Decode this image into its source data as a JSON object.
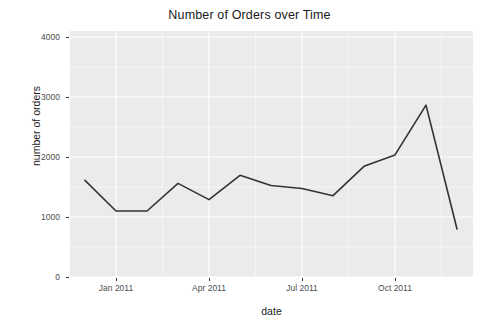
{
  "chart_data": {
    "type": "line",
    "title": "Number of Orders over Time",
    "xlabel": "date",
    "ylabel": "number of orders",
    "grid": true,
    "legend": "none",
    "panel_background": "#ebebeb",
    "grid_color": "#ffffff",
    "line_color": "#333333",
    "ylim": [
      0,
      4100
    ],
    "y_ticks": [
      {
        "value": 0,
        "label": "0"
      },
      {
        "value": 1000,
        "label": "1000"
      },
      {
        "value": 2000,
        "label": "2000"
      },
      {
        "value": 3000,
        "label": "3000"
      },
      {
        "value": 4000,
        "label": "4000"
      }
    ],
    "x_ticks": [
      {
        "x": "2011-01",
        "label": "Jan 2011"
      },
      {
        "x": "2011-04",
        "label": "Apr 2011"
      },
      {
        "x": "2011-07",
        "label": "Jul 2011"
      },
      {
        "x": "2011-10",
        "label": "Oct 2011"
      }
    ],
    "x": [
      "2010-12",
      "2011-01",
      "2011-02",
      "2011-03",
      "2011-04",
      "2011-05",
      "2011-06",
      "2011-07",
      "2011-08",
      "2011-09",
      "2011-10",
      "2011-11",
      "2011-12"
    ],
    "values": [
      1610,
      1100,
      1100,
      1560,
      1290,
      1695,
      1525,
      1475,
      1355,
      1845,
      2035,
      2865,
      800
    ],
    "series": [
      {
        "name": "number of orders",
        "values": [
          1610,
          1100,
          1100,
          1560,
          1290,
          1695,
          1525,
          1475,
          1355,
          1845,
          2035,
          2865,
          800
        ]
      }
    ]
  }
}
